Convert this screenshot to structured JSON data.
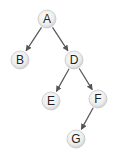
{
  "diagram": {
    "type": "binary-tree",
    "nodes": [
      {
        "id": "A",
        "label": "A",
        "x": 47,
        "y": 19
      },
      {
        "id": "B",
        "label": "B",
        "x": 20,
        "y": 60
      },
      {
        "id": "D",
        "label": "D",
        "x": 74,
        "y": 60
      },
      {
        "id": "E",
        "label": "E",
        "x": 51,
        "y": 101
      },
      {
        "id": "F",
        "label": "F",
        "x": 98,
        "y": 99
      },
      {
        "id": "G",
        "label": "G",
        "x": 76,
        "y": 139
      }
    ],
    "edges": [
      {
        "from": "A",
        "to": "B"
      },
      {
        "from": "A",
        "to": "D"
      },
      {
        "from": "D",
        "to": "E"
      },
      {
        "from": "D",
        "to": "F"
      },
      {
        "from": "F",
        "to": "G"
      }
    ],
    "colors": {
      "edge": "#555555",
      "node_fill_center": "#ffffff",
      "node_fill_edge": "#d4d4d4",
      "node_stroke": "#c8c8c8",
      "label": "#222222"
    }
  }
}
